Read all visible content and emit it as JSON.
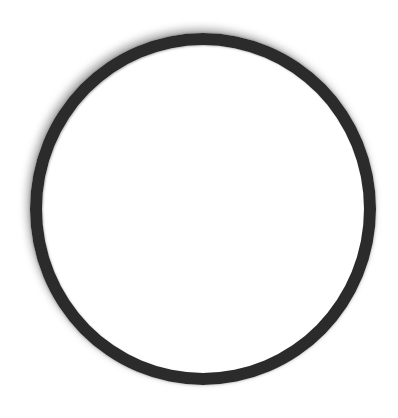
{
  "image": {
    "description": "Black circular ring on white background",
    "shape": "ring",
    "colors": {
      "background": "#ffffff",
      "ring": "#2b2b2b"
    }
  }
}
